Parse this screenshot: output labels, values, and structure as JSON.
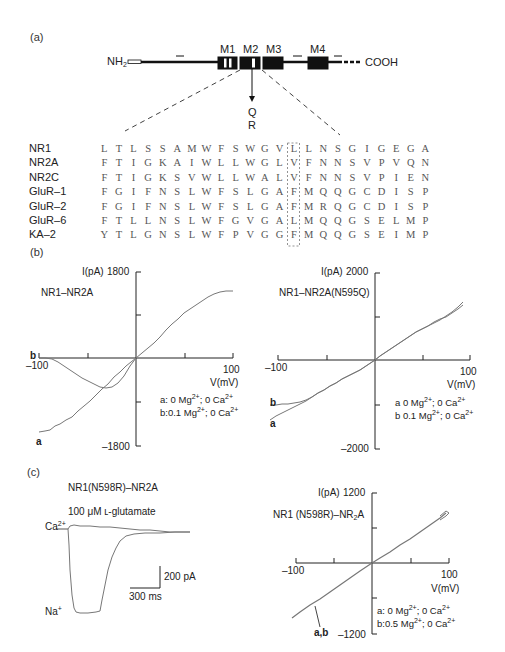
{
  "panel_a": {
    "label": "(a)",
    "schematic": {
      "n_terminus": "NH",
      "n_terminus_sub": "2",
      "c_terminus": "COOH",
      "segments": [
        "M1",
        "M2",
        "M3",
        "M4"
      ],
      "site_arrow_labels": [
        "Q",
        "R"
      ]
    },
    "alignment": {
      "names": [
        "NR1",
        "NR2A",
        "NR2C",
        "GluR–1",
        "GluR–2",
        "GluR–6",
        "KA–2"
      ],
      "sequences": [
        "LTLSSAMWFSWGVLLNSGIGEGA",
        "FTIGKAIWLLWGLVFNNSVPVQN",
        "FTIGKSVWLLWALVFNNSVPIEN",
        "FGIFNSLWFSLGAFMQQGCDISP",
        "FGIFNSLWFSLGAFMRQGCDISP",
        "FTLLNSLWFGVGALMQQGSELMP",
        "YTLGNSLWFPVGGFMQQGSEIMP"
      ],
      "highlighted_position": 16
    }
  },
  "panel_b": {
    "label": "(b)",
    "left": {
      "title": "NR1–NR2A",
      "y_label": "I(pA)",
      "y_max": "1800",
      "y_min": "–1800",
      "x_min": "–100",
      "x_max": "100",
      "x_label": "V(mV)",
      "curve_labels": [
        "a",
        "b"
      ],
      "legend_a": "a: 0 Mg",
      "legend_a_ca": "; 0 Ca",
      "legend_b": "b:0.1 Mg",
      "legend_b_ca": "; 0 Ca",
      "sup": "2+"
    },
    "right": {
      "title": "NR1–NR2A(N595Q)",
      "y_label": "I(pA)",
      "y_max": "2000",
      "y_min": "–2000",
      "x_min": "–100",
      "x_max": "100",
      "x_label": "V(mV)",
      "curve_labels": [
        "a",
        "b"
      ],
      "legend_a": "a 0 Mg",
      "legend_a_ca": "; 0 Ca",
      "legend_b": "b 0.1 Mg",
      "legend_b_ca": "; 0 Ca",
      "sup": "2+"
    }
  },
  "panel_c": {
    "label": "(c)",
    "trace": {
      "title": "NR1(N598R)–NR2A",
      "agonist": "100 μM ʟ-glutamate",
      "ca_label": "Ca",
      "na_label": "Na",
      "ca_sup": "2+",
      "na_sup": "+",
      "scale_y": "200 pA",
      "scale_x": "300 ms"
    },
    "iv": {
      "title_pre": "NR1 (N598R)–NR",
      "title_sub": "2",
      "title_post": "A",
      "y_label": "I(pA)",
      "y_max": "1200",
      "y_min": "–1200",
      "x_min": "–100",
      "x_max": "100",
      "x_label": "V(mV)",
      "curve_label": "a,b",
      "legend_a": "a: 0 Mg",
      "legend_a_ca": "; 0 Ca",
      "legend_b": "b:0.5 Mg",
      "legend_b_ca": "; 0 Ca",
      "sup": "2+"
    }
  },
  "chart_data": [
    {
      "type": "line",
      "title": "NR1–NR2A",
      "xlabel": "V(mV)",
      "ylabel": "I(pA)",
      "xlim": [
        -100,
        100
      ],
      "ylim": [
        -1800,
        1800
      ],
      "series": [
        {
          "name": "a: 0 Mg2+; 0 Ca2+",
          "x": [
            -100,
            -80,
            -60,
            -40,
            -20,
            0,
            20,
            40,
            60,
            80,
            100
          ],
          "y": [
            -1450,
            -1250,
            -1000,
            -700,
            -350,
            0,
            400,
            800,
            1100,
            1300,
            1350
          ]
        },
        {
          "name": "b: 0.1 Mg2+; 0 Ca2+",
          "x": [
            -100,
            -80,
            -60,
            -40,
            -30,
            -20,
            -10,
            0
          ],
          "y": [
            0,
            -60,
            -250,
            -450,
            -460,
            -380,
            -200,
            0
          ]
        }
      ]
    },
    {
      "type": "line",
      "title": "NR1–NR2A(N595Q)",
      "xlabel": "V(mV)",
      "ylabel": "I(pA)",
      "xlim": [
        -100,
        100
      ],
      "ylim": [
        -2000,
        2000
      ],
      "series": [
        {
          "name": "a 0 Mg2+; 0 Ca2+",
          "x": [
            -100,
            -80,
            -60,
            -40,
            -20,
            0,
            20,
            40,
            60,
            80,
            95
          ],
          "y": [
            -1550,
            -1250,
            -950,
            -650,
            -350,
            0,
            450,
            850,
            1150,
            1400,
            1650
          ]
        },
        {
          "name": "b 0.1 Mg2+; 0 Ca2+",
          "x": [
            -100,
            -80,
            -60,
            -40,
            -20,
            0,
            20,
            40,
            60,
            80,
            95
          ],
          "y": [
            -1250,
            -1150,
            -950,
            -650,
            -350,
            0,
            450,
            850,
            1150,
            1400,
            1600
          ]
        }
      ]
    },
    {
      "type": "line",
      "title": "NR1(N598R)–NR2A current trace (100 μM L-glutamate)",
      "xlabel": "time (scale 300 ms)",
      "ylabel": "current (scale 200 pA)",
      "series": [
        {
          "name": "Ca2+",
          "description": "small, nearly flat response"
        },
        {
          "name": "Na+",
          "description": "large inward current (~ -780 pA) decaying over ~1.2 s"
        }
      ]
    },
    {
      "type": "line",
      "title": "NR1 (N598R)–NR2A",
      "xlabel": "V(mV)",
      "ylabel": "I(pA)",
      "xlim": [
        -100,
        100
      ],
      "ylim": [
        -1200,
        1200
      ],
      "series": [
        {
          "name": "a: 0 Mg2+; 0 Ca2+",
          "x": [
            -100,
            -50,
            0,
            50,
            95
          ],
          "y": [
            -850,
            -430,
            0,
            430,
            840
          ]
        },
        {
          "name": "b: 0.5 Mg2+; 0 Ca2+",
          "x": [
            -100,
            -50,
            0,
            50,
            95
          ],
          "y": [
            -850,
            -430,
            0,
            430,
            820
          ]
        }
      ]
    }
  ]
}
